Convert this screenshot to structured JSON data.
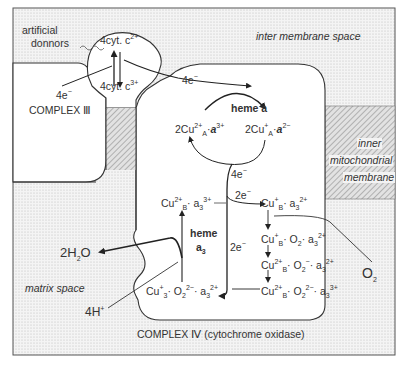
{
  "regions": {
    "intermembrane_space": "inter membrane space",
    "inner_membrane_line1": "inner",
    "inner_membrane_line2": "mitochondrial",
    "inner_membrane_line3": "membrane",
    "matrix_space": "matrix space"
  },
  "complexes": {
    "complex_iii": "COMPLEX Ⅲ",
    "complex_iv": "COMPLEX Ⅳ (cytochrome oxidase)"
  },
  "donors": {
    "label_line1": "artificial",
    "label_line2": "donnors"
  },
  "cytochrome_c": {
    "reduced": "4cyt. c",
    "reduced_charge": "2+",
    "oxidized": "4cyt. c",
    "oxidized_charge": "3+"
  },
  "electrons": {
    "e4_left": "4e",
    "e4_right": "4e",
    "e4_heme": "4e",
    "e2_top": "2e",
    "e2_mid": "2e",
    "minus": "−"
  },
  "heme_a": {
    "label": "heme a",
    "left_state": {
      "coef": "2Cu",
      "cu_sup": "2+",
      "cu_sub": "A",
      "dot": "·",
      "heme": "a",
      "heme_sup": "3+"
    },
    "right_state": {
      "coef": "2Cu",
      "cu_sup": "+",
      "cu_sub": "A",
      "dot": "·",
      "heme": "a",
      "heme_sup": "2−"
    }
  },
  "heme_a3": {
    "label_line1": "heme",
    "label_line2": "a",
    "label_sub": "3",
    "states": [
      {
        "id": "cuB2_a3_3",
        "text": "Cu",
        "sup": "2+",
        "sub": "B",
        "rest": "· a",
        "rest_sub": "3",
        "rest_sup": "3+"
      },
      {
        "id": "cuB1_a3_2",
        "text": "Cu",
        "sup": "+",
        "sub": "B",
        "rest": "· a",
        "rest_sub": "3",
        "rest_sup": "2+"
      },
      {
        "id": "cuB1_o2_a3_2",
        "text": "Cu",
        "sup": "+",
        "sub": "B",
        "mid": "· O",
        "mid_sub": "2",
        "rest": "· a",
        "rest_sub": "3",
        "rest_sup": "2+"
      },
      {
        "id": "cuB2_o2m_a3_2",
        "text": "Cu",
        "sup": "2+",
        "sub": "B",
        "mid": "· O",
        "mid_sub": "2",
        "mid_sup": "−",
        "rest": "· a",
        "rest_sub": "3",
        "rest_sup": "2+"
      },
      {
        "id": "cuB2_o22m_a3_3",
        "text": "Cu",
        "sup": "2+",
        "sub": "B",
        "mid": "· O",
        "mid_sub": "2",
        "mid_sup": "2−",
        "rest": "· a",
        "rest_sub": "3",
        "rest_sup": "3+"
      },
      {
        "id": "cu3_o22m_a3_2",
        "text": "Cu",
        "sup": "+",
        "sub": "3",
        "mid": "· O",
        "mid_sub": "2",
        "mid_sup": "2−",
        "rest": "· a",
        "rest_sub": "3",
        "rest_sup": "2+"
      }
    ]
  },
  "substrates": {
    "water": "2H",
    "water_sub": "2",
    "water_tail": "O",
    "protons": "4H",
    "protons_sup": "+",
    "oxygen": "O",
    "oxygen_sub": "2"
  },
  "colors": {
    "stipple_bg": "#eeeeee",
    "hatch": "#9a9a9a",
    "line": "#2a2a2a",
    "text": "#333333"
  }
}
